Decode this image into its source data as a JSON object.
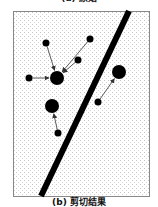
{
  "captions": {
    "top": "(a) 原始",
    "bottom": "(b) 剪切结果"
  },
  "colors": {
    "frame": "#888888",
    "dots": "#000000",
    "background_stipple": "#c8c8c8"
  },
  "diagram": {
    "frame": {
      "x": 13,
      "y": 11,
      "width": 136,
      "height": 185
    },
    "divider_line": {
      "x1": 129,
      "y1": 11,
      "x2": 41,
      "y2": 196,
      "width": 6
    },
    "large_points": [
      {
        "id": "P1",
        "x": 57,
        "y": 78,
        "r": 7
      },
      {
        "id": "P2",
        "x": 52,
        "y": 106,
        "r": 7
      },
      {
        "id": "P3",
        "x": 119,
        "y": 72,
        "r": 7
      }
    ],
    "small_points": [
      {
        "id": "a",
        "x": 46,
        "y": 43,
        "r": 3.5,
        "target": "P1"
      },
      {
        "id": "b",
        "x": 90,
        "y": 39,
        "r": 3.5,
        "target": "P1"
      },
      {
        "id": "c",
        "x": 78,
        "y": 60,
        "r": 3.5,
        "target": "P1"
      },
      {
        "id": "d",
        "x": 29,
        "y": 78,
        "r": 3.5,
        "target": "P1"
      },
      {
        "id": "e",
        "x": 58,
        "y": 133,
        "r": 3.5,
        "target": "P2"
      },
      {
        "id": "f",
        "x": 98,
        "y": 102,
        "r": 3.5,
        "target": "P3"
      }
    ]
  }
}
